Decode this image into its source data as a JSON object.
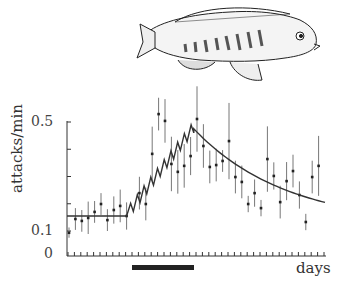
{
  "chart_data": {
    "type": "scatter",
    "title": "",
    "xlabel": "days",
    "ylabel": "attacks/min",
    "y_tick_labels": [
      "0.5",
      "0.1",
      "0"
    ],
    "ylim": [
      0,
      0.5
    ],
    "y_axis_break": "axis compressed between 0 and 0.1",
    "x_range_days": [
      0,
      40
    ],
    "grid": false,
    "legend": null,
    "illustration": "fish (cichlid) drawing above plot",
    "treatment_bar": {
      "start_day": 10,
      "end_day": 20,
      "color": "#222222"
    },
    "series": [
      {
        "name": "observed attacks (mean ± error)",
        "type": "scatter_errorbar",
        "x": [
          0,
          1,
          2,
          3,
          4,
          5,
          6,
          7,
          8,
          9,
          11,
          12,
          13,
          14,
          15,
          16,
          17,
          18,
          19,
          20,
          21,
          22,
          23,
          24,
          25,
          26,
          27,
          28,
          29,
          30,
          31,
          32,
          33,
          34,
          35,
          36,
          37,
          38,
          39
        ],
        "values": [
          0.093,
          0.144,
          0.137,
          0.148,
          0.17,
          0.199,
          0.14,
          0.177,
          0.192,
          0.155,
          0.239,
          0.199,
          0.383,
          0.529,
          0.504,
          0.346,
          0.317,
          0.339,
          0.375,
          0.511,
          0.412,
          0.335,
          0.342,
          0.357,
          0.43,
          0.298,
          0.28,
          0.199,
          0.239,
          0.184,
          0.364,
          0.302,
          0.206,
          0.283,
          0.32,
          0.232,
          0.133,
          0.298,
          0.339
        ],
        "err": [
          0.02,
          0.04,
          0.04,
          0.06,
          0.04,
          0.04,
          0.04,
          0.05,
          0.06,
          0.05,
          0.06,
          0.06,
          0.1,
          0.06,
          0.08,
          0.1,
          0.08,
          0.08,
          0.07,
          0.12,
          0.08,
          0.06,
          0.06,
          0.04,
          0.14,
          0.06,
          0.06,
          0.03,
          0.05,
          0.03,
          0.12,
          0.05,
          0.06,
          0.07,
          0.06,
          0.05,
          0.03,
          0.06,
          0.11
        ]
      },
      {
        "name": "model fit",
        "type": "line",
        "baseline": 0.155,
        "peak": {
          "day": 19.5,
          "value": 0.475
        },
        "end": {
          "day": 40,
          "value": 0.205
        },
        "shape": "flat baseline, sawtooth rise during treatment, exponential decay after"
      }
    ]
  },
  "labels": {
    "ylabel": "attacks/min",
    "xlabel": "days",
    "y_top": "0.5",
    "y_mid": "0.1",
    "y_zero": "0"
  }
}
